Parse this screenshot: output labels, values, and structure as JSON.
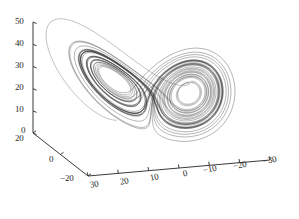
{
  "figure": {
    "title": "",
    "background_color": "#ffffff",
    "line_color": "#323232",
    "axis_color": "#3a3a3a",
    "transient_color": "#6e6e6e"
  },
  "chart_data": {
    "type": "line",
    "plot_kind": "3d-phase-portrait",
    "title": "",
    "xlabel": "",
    "ylabel": "",
    "zlabel": "",
    "grid": false,
    "legend": null,
    "view": {
      "azimuth_deg": -37.5,
      "elevation_deg": 30
    },
    "axes": {
      "x": {
        "label": "",
        "ticks": [
          30,
          20,
          10,
          0,
          -10,
          -20,
          -30
        ],
        "tick_labels": [
          "30",
          "20",
          "10",
          "0",
          "-10",
          "-20",
          "-30"
        ],
        "range": [
          30,
          -30
        ],
        "direction": "descending-left-to-right"
      },
      "y": {
        "label": "",
        "ticks": [
          20,
          0,
          -20
        ],
        "tick_labels": [
          "20",
          "0",
          "-20"
        ],
        "range": [
          20,
          -20
        ],
        "direction": "descending-top-to-bottom"
      },
      "z": {
        "label": "",
        "ticks": [
          0,
          10,
          20,
          30,
          40,
          50
        ],
        "tick_labels": [
          "0",
          "10",
          "20",
          "30",
          "40",
          "50"
        ],
        "range": [
          0,
          50
        ],
        "direction": "ascending-bottom-to-top"
      }
    },
    "system": {
      "name": "Lorenz attractor",
      "equations": [
        "dx/dt = sigma*(y-x)",
        "dy/dt = x*(rho-z)-y",
        "dz/dt = x*y-beta*z"
      ],
      "sigma": 10,
      "rho": 28,
      "beta": 2.6666666667,
      "initial_condition": [
        -8.0,
        8.0,
        27.0
      ],
      "dt": 0.0045,
      "steps": 9000,
      "transient_initial_condition": [
        0.6,
        22.0,
        1.2
      ],
      "transient_dt": 0.0045,
      "transient_steps": 520
    }
  },
  "tick_labels": {
    "z": [
      {
        "text": "50",
        "x": 15,
        "y": 17
      },
      {
        "text": "40",
        "x": 15,
        "y": 39
      },
      {
        "text": "30",
        "x": 15,
        "y": 61
      },
      {
        "text": "20",
        "x": 15,
        "y": 83
      },
      {
        "text": "10",
        "x": 15,
        "y": 105
      },
      {
        "text": "0",
        "x": 21,
        "y": 126
      }
    ],
    "y": [
      {
        "text": "20",
        "x": 15,
        "y": 134,
        "rot": 0
      },
      {
        "text": "0",
        "x": 49,
        "y": 155,
        "rot": 0
      },
      {
        "text": "-20",
        "x": 60,
        "y": 174,
        "rot": 0
      }
    ],
    "x": [
      {
        "text": "30",
        "x": 90,
        "y": 180,
        "rot": -12
      },
      {
        "text": "20",
        "x": 120,
        "y": 177,
        "rot": -12
      },
      {
        "text": "10",
        "x": 150,
        "y": 173,
        "rot": -12
      },
      {
        "text": "0",
        "x": 183,
        "y": 169,
        "rot": -12
      },
      {
        "text": "-10",
        "x": 203,
        "y": 165,
        "rot": -12
      },
      {
        "text": "-20",
        "x": 233,
        "y": 161,
        "rot": -12
      },
      {
        "text": "-30",
        "x": 263,
        "y": 156,
        "rot": -12
      }
    ]
  }
}
